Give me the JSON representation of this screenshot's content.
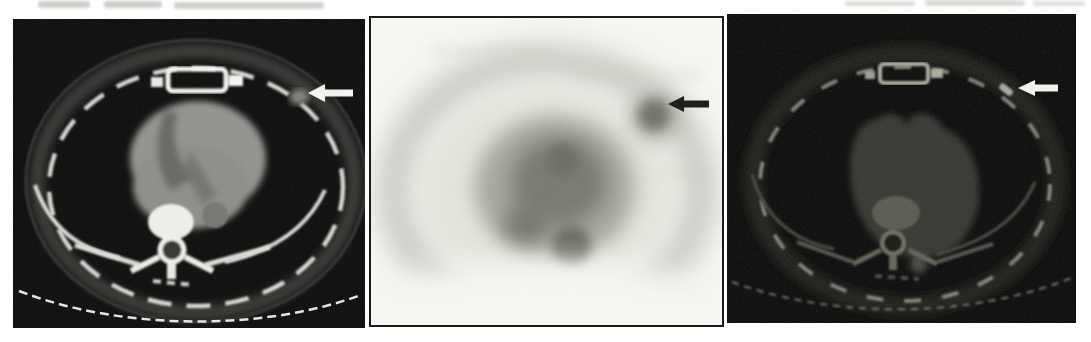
{
  "page": {
    "background": "#ffffff",
    "top_artifacts": "illegible blurred show-through text smudges from scanned journal page"
  },
  "figure": {
    "name": "three-panel axial chest imaging figure",
    "panels": [
      {
        "name": "ct-contrast-axial",
        "content": "axial chest CT, soft-tissue window, heart and ribs visible",
        "background": "#0b0b0b",
        "arrow": {
          "icon": "arrow-left-icon",
          "color": "#f4f4ef",
          "points_at": "right chest wall nodule"
        }
      },
      {
        "name": "pet-inverted-axial",
        "content": "axial PET slice, inverted grayscale, focal uptake at right chest wall",
        "background": "#f6f6f2",
        "border_color": "#1b1b19",
        "arrow": {
          "icon": "arrow-left-icon",
          "color": "#1f1f1d",
          "points_at": "focal tracer uptake"
        }
      },
      {
        "name": "ct-dark-axial",
        "content": "axial chest CT, dim low-contrast rendering, heart and ribs faint",
        "background": "#070707",
        "arrow": {
          "icon": "arrow-left-icon",
          "color": "#f2f2ed",
          "points_at": "right chest wall nodule"
        }
      }
    ]
  }
}
